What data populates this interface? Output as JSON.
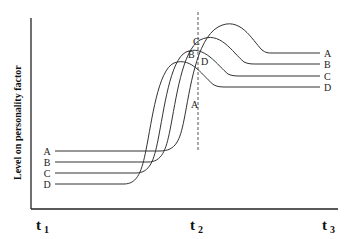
{
  "diagram": {
    "y_axis_label": "Level on personality factor",
    "x_ticks": [
      {
        "main": "t",
        "sub": "1",
        "x": 36,
        "y": 230
      },
      {
        "main": "t",
        "sub": "2",
        "x": 190,
        "y": 230
      },
      {
        "main": "t",
        "sub": "3",
        "x": 322,
        "y": 230
      }
    ],
    "curves": [
      {
        "name": "A",
        "left_y": 151,
        "right_y": 53,
        "path": "M 55 151 L 160 151 C 176 151 180 140 184 120 C 190 90 196 40 218 27 C 240 15 252 40 262 50 C 266 53 268 53 272 53 L 320 53"
      },
      {
        "name": "B",
        "left_y": 162,
        "right_y": 64,
        "path": "M 55 162 L 148 162 C 162 162 166 150 170 130 C 176 100 182 50 200 40 C 220 30 232 52 244 62 C 248 64 252 64 256 64 L 320 64"
      },
      {
        "name": "C",
        "left_y": 173,
        "right_y": 76,
        "path": "M 55 173 L 136 173 C 150 173 154 160 158 140 C 164 110 170 60 186 52 C 204 44 218 66 228 74 C 232 76 236 76 240 76 L 320 76"
      },
      {
        "name": "D",
        "left_y": 184,
        "right_y": 87,
        "path": "M 55 184 L 124 184 C 138 184 142 170 146 150 C 152 120 158 70 174 63 C 192 56 204 78 214 85 C 218 87 222 87 226 87 L 320 87"
      }
    ],
    "mid_labels": [
      {
        "text": "C",
        "x": 193,
        "y": 45
      },
      {
        "text": "B",
        "x": 188,
        "y": 58
      },
      {
        "text": "D",
        "x": 201,
        "y": 65
      },
      {
        "text": "A",
        "x": 191,
        "y": 108
      }
    ],
    "dashed_x": 198,
    "left_label_x": 47,
    "right_label_x": 324
  }
}
